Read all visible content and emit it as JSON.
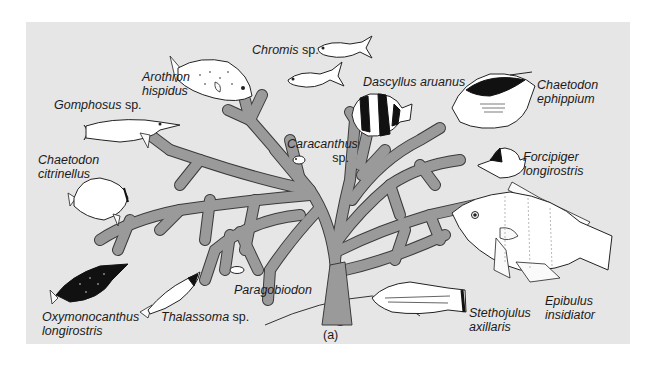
{
  "figure": {
    "panel_label": "(a)",
    "background_color": "#e6e6e6",
    "coral_color": "#9a9a9a"
  },
  "labels": {
    "arothron": {
      "genus": "Arothron",
      "species": "hispidus"
    },
    "chromis": {
      "genus": "Chromis",
      "suffix": " sp."
    },
    "dascyllus": {
      "text": "Dascyllus aruanus"
    },
    "chaetodon_eph": {
      "genus": "Chaetodon",
      "species": "ephippium"
    },
    "gomphosus": {
      "genus": "Gomphosus",
      "suffix": " sp."
    },
    "caracanthus": {
      "genus": "Caracanthus",
      "suffix": "sp."
    },
    "forcipiger": {
      "genus": "Forcipiger",
      "species": "longirostris"
    },
    "chaetodon_cit": {
      "genus": "Chaetodon",
      "species": "citrinellus"
    },
    "paragobiodon": {
      "text": "Paragobiodon"
    },
    "oxymonocanthus": {
      "genus": "Oxymonocanthus",
      "species": "longirostris"
    },
    "thalassoma": {
      "genus": "Thalassoma",
      "suffix": " sp."
    },
    "stethojulus": {
      "genus": "Stethojulus",
      "species": "axillaris"
    },
    "epibulus": {
      "genus": "Epibulus",
      "species": "insidiator"
    }
  }
}
